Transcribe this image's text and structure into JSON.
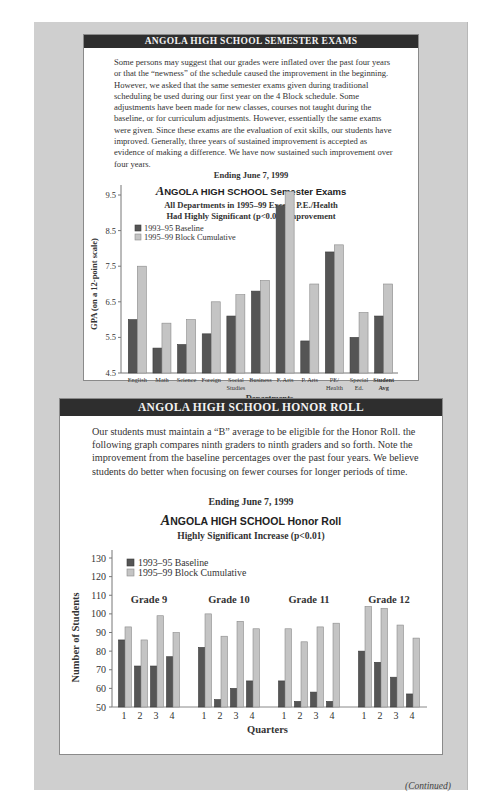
{
  "section1": {
    "banner": "ANGOLA HIGH SCHOOL SEMESTER EXAMS",
    "paragraph": "Some persons may suggest that our grades were inflated over the past four years or that the “newness” of the schedule caused the improvement in the beginning. However, we asked that the same semester exams given during traditional scheduling be used during our first year on the 4 Block schedule. Some adjustments have been made for new classes, courses not taught during the baseline, or for curriculum adjustments. However, essentially the same exams were given. Since these exams are the evaluation of exit skills, our students have improved. Generally, three years of sustained improvement is accepted as evidence of making a difference. We have now sustained such improvement over four years.",
    "ending": "Ending June 7, 1999",
    "chart_title_initial": "A",
    "chart_title_rest": "NGOLA HIGH SCHOOL Semester Exams",
    "chart_subtitle_1": "All Departments in 1995–99 Except P.E./Health",
    "chart_subtitle_2": "Had Highly Significant (p<0.01) Improvement"
  },
  "section2": {
    "banner": "ANGOLA HIGH SCHOOL HONOR ROLL",
    "paragraph": "Our students must maintain a “B” average to be eligible for the Honor Roll. the following graph compares ninth graders to ninth graders and so forth. Note the improvement from the baseline percentages over the past four years. We believe students do better when focusing on fewer courses for longer periods of time.",
    "ending": "Ending June 7, 1999",
    "chart_title_initial": "A",
    "chart_title_rest": "NGOLA HIGH SCHOOL Honor Roll",
    "chart_subtitle": "Highly Significant Increase (p<0.01)"
  },
  "footer": {
    "continued": "(Continued)"
  },
  "colors": {
    "baseline": "#555555",
    "block": "#c4c4c4",
    "banner": "#2e2e2e",
    "frame": "#cfcfcf"
  },
  "chart_data": [
    {
      "type": "bar",
      "title": "ANGOLA HIGH SCHOOL Semester Exams",
      "subtitle": "All Departments in 1995–99 Except P.E./Health Had Highly Significant (p<0.01) Improvement",
      "xlabel": "Departments",
      "ylabel": "GPA (on a 12-point scale)",
      "ylim": [
        4.5,
        9.5
      ],
      "yticks": [
        4.5,
        5.5,
        6.5,
        7.5,
        8.5,
        9.5
      ],
      "legend_position": "upper-left",
      "grid": false,
      "categories": [
        "English",
        "Math",
        "Science",
        "Foreign",
        "Social Studies",
        "Business",
        "F. Arts",
        "P. Arts",
        "PE/ Health",
        "Special Ed.",
        "Student Avg"
      ],
      "series": [
        {
          "name": "1993–95 Baseline",
          "values": [
            6.0,
            5.2,
            5.3,
            5.6,
            6.1,
            6.8,
            9.2,
            5.4,
            7.9,
            5.5,
            6.1
          ]
        },
        {
          "name": "1995–99 Block Cumulative",
          "values": [
            7.5,
            5.9,
            6.0,
            6.5,
            6.7,
            7.1,
            9.6,
            7.0,
            8.1,
            6.2,
            7.0
          ]
        }
      ]
    },
    {
      "type": "bar",
      "title": "ANGOLA HIGH SCHOOL Honor Roll",
      "subtitle": "Highly Significant Increase (p<0.01)",
      "xlabel": "Quarters",
      "ylabel": "Number of Students",
      "ylim": [
        50,
        130
      ],
      "yticks": [
        50,
        60,
        70,
        80,
        90,
        100,
        110,
        120,
        130
      ],
      "legend_position": "upper-left",
      "grid": false,
      "groups": [
        "Grade 9",
        "Grade 10",
        "Grade 11",
        "Grade 12"
      ],
      "categories": [
        "1",
        "2",
        "3",
        "4"
      ],
      "series": [
        {
          "name": "1993–95 Baseline",
          "values": {
            "Grade 9": [
              86,
              72,
              72,
              77
            ],
            "Grade 10": [
              82,
              54,
              60,
              64
            ],
            "Grade 11": [
              64,
              53,
              58,
              53
            ],
            "Grade 12": [
              80,
              74,
              66,
              57
            ]
          }
        },
        {
          "name": "1995–99 Block Cumulative",
          "values": {
            "Grade 9": [
              93,
              86,
              99,
              90
            ],
            "Grade 10": [
              100,
              88,
              96,
              92
            ],
            "Grade 11": [
              92,
              85,
              93,
              95
            ],
            "Grade 12": [
              104,
              103,
              94,
              87
            ]
          }
        }
      ]
    }
  ]
}
